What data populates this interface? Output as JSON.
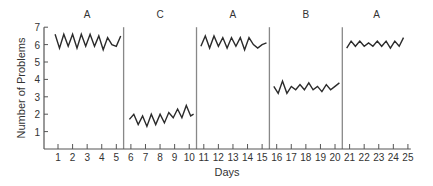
{
  "chart_data": {
    "type": "line",
    "title": "",
    "xlabel": "Days",
    "ylabel": "Number of Problems",
    "xlim": [
      0,
      25.2
    ],
    "ylim": [
      0,
      7
    ],
    "x_ticks": [
      1,
      2,
      3,
      4,
      5,
      6,
      7,
      8,
      9,
      10,
      11,
      12,
      13,
      14,
      15,
      16,
      17,
      18,
      19,
      20,
      21,
      22,
      23,
      24,
      25
    ],
    "y_ticks": [
      1,
      2,
      3,
      4,
      5,
      6,
      7
    ],
    "grid": false,
    "legend": null,
    "phase_dividers": [
      5.5,
      10.5,
      15.5,
      20.5
    ],
    "phases": [
      {
        "label": "A",
        "start": 0.5,
        "end": 5.5
      },
      {
        "label": "C",
        "start": 5.5,
        "end": 10.5
      },
      {
        "label": "A",
        "start": 10.5,
        "end": 15.5
      },
      {
        "label": "B",
        "start": 15.5,
        "end": 20.5
      },
      {
        "label": "A",
        "start": 20.5,
        "end": 25.5
      }
    ],
    "series": [
      {
        "name": "Phase A (days 1-5)",
        "x": [
          0.8,
          1.1,
          1.4,
          1.7,
          2.0,
          2.3,
          2.6,
          2.9,
          3.2,
          3.5,
          3.8,
          4.1,
          4.4,
          4.7,
          5.0,
          5.3
        ],
        "y": [
          6.6,
          5.8,
          6.6,
          5.9,
          6.6,
          5.8,
          6.6,
          5.9,
          6.6,
          5.9,
          6.5,
          5.7,
          6.4,
          6.0,
          5.9,
          6.5
        ]
      },
      {
        "name": "Phase C (days 6-10)",
        "x": [
          5.9,
          6.2,
          6.5,
          6.8,
          7.1,
          7.4,
          7.7,
          8.0,
          8.3,
          8.6,
          8.9,
          9.2,
          9.5,
          9.8,
          10.1,
          10.3
        ],
        "y": [
          1.7,
          2.0,
          1.4,
          1.9,
          1.3,
          2.0,
          1.4,
          2.0,
          1.5,
          2.1,
          1.8,
          2.3,
          1.8,
          2.5,
          1.9,
          2.0
        ]
      },
      {
        "name": "Phase A (days 11-15)",
        "x": [
          10.8,
          11.1,
          11.4,
          11.7,
          12.0,
          12.3,
          12.6,
          12.9,
          13.2,
          13.5,
          13.8,
          14.1,
          14.4,
          14.7,
          15.0,
          15.3
        ],
        "y": [
          5.9,
          6.5,
          5.8,
          6.5,
          5.9,
          6.4,
          5.8,
          6.4,
          5.9,
          6.4,
          5.7,
          6.4,
          6.0,
          5.8,
          6.0,
          6.1
        ]
      },
      {
        "name": "Phase B (days 16-20)",
        "x": [
          15.8,
          16.1,
          16.4,
          16.7,
          17.0,
          17.3,
          17.6,
          17.9,
          18.2,
          18.5,
          18.8,
          19.1,
          19.4,
          19.7,
          20.0,
          20.3
        ],
        "y": [
          3.6,
          3.2,
          3.9,
          3.2,
          3.6,
          3.4,
          3.7,
          3.4,
          3.8,
          3.4,
          3.6,
          3.3,
          3.7,
          3.4,
          3.6,
          3.8
        ]
      },
      {
        "name": "Phase A (days 21-25)",
        "x": [
          20.8,
          21.1,
          21.4,
          21.7,
          22.0,
          22.3,
          22.6,
          22.9,
          23.2,
          23.5,
          23.8,
          24.1,
          24.4,
          24.7
        ],
        "y": [
          5.8,
          6.2,
          5.9,
          6.2,
          5.9,
          6.1,
          5.9,
          6.2,
          5.9,
          6.2,
          5.8,
          6.2,
          5.9,
          6.4
        ]
      }
    ]
  },
  "colors": {
    "line": "#2b2b2b",
    "axis": "#555555",
    "divider": "#888888",
    "text": "#333333"
  }
}
